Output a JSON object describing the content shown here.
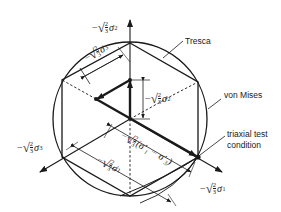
{
  "diagram": {
    "labels": {
      "tresca": "Tresca",
      "von_mises": "von Mises",
      "triaxial_line1": "triaxial test",
      "triaxial_line2": "condition"
    },
    "axes": {
      "sigma2": {
        "sign": "−",
        "sqrt": "√",
        "num": "2",
        "den": "3",
        "sym": "σ",
        "sub": "2",
        "prime": "′"
      },
      "sigma3": {
        "sign": "−",
        "sqrt": "√",
        "num": "2",
        "den": "3",
        "sym": "σ",
        "sub": "3",
        "prime": "′"
      },
      "sigma1": {
        "sign": "−",
        "sqrt": "√",
        "num": "2",
        "den": "3",
        "sym": "σ",
        "sub": "1",
        "prime": "′"
      }
    },
    "dimensions": {
      "d_sigma3": {
        "sign": "−",
        "sqrt": "√",
        "num": "2",
        "den": "3",
        "sym": "σ",
        "sub": "3",
        "prime": "′"
      },
      "d_sigma2": {
        "sign": "−",
        "sqrt": "√",
        "num": "2",
        "den": "3",
        "sym": "σ",
        "sub": "2",
        "prime": "′"
      },
      "d_diff": {
        "sign": "−",
        "sqrt": "√",
        "num": "2",
        "den": "3",
        "expr": "(σ′₁ − σ′₃)"
      },
      "d_sigma1": {
        "sign": "−",
        "sqrt": "√",
        "num": "2",
        "den": "3",
        "sym": "σ",
        "sub": "1",
        "prime": "′"
      }
    },
    "colors": {
      "ink": "#1a1a1a",
      "background": "#ffffff"
    }
  }
}
